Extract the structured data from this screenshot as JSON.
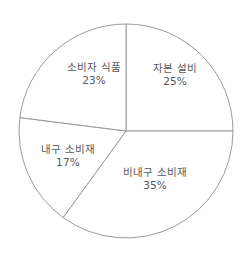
{
  "chart_data": {
    "type": "pie",
    "title": "",
    "categories": [
      "자본 설비",
      "비내구 소비재",
      "내구 소비재",
      "소비자 식품"
    ],
    "values": [
      25,
      35,
      17,
      23
    ],
    "value_labels": [
      "25%",
      "35%",
      "17%",
      "23%"
    ],
    "unit": "%",
    "legend": "none",
    "grid": false,
    "start_angle_deg": 0,
    "direction": "clockwise",
    "slice_fill": "#ffffff",
    "slice_stroke": "#9b9b9b",
    "label_color": "#575757",
    "background": "#ffffff",
    "slices": [
      {
        "label": "자본 설비",
        "value": 25,
        "value_label": "25%",
        "start_deg": 0,
        "end_deg": 90,
        "label_x_pct": 70.6,
        "label_y_pct": 28.6
      },
      {
        "label": "비내구 소비재",
        "value": 35,
        "value_label": "35%",
        "start_deg": 90,
        "end_deg": 216,
        "label_x_pct": 62.5,
        "label_y_pct": 68.3
      },
      {
        "label": "내구 소비재",
        "value": 17,
        "value_label": "17%",
        "start_deg": 216,
        "end_deg": 277.2,
        "label_x_pct": 27.4,
        "label_y_pct": 59.5
      },
      {
        "label": "소비자 식품",
        "value": 23,
        "value_label": "23%",
        "start_deg": 277.2,
        "end_deg": 360,
        "label_x_pct": 37.9,
        "label_y_pct": 28.2
      }
    ]
  },
  "geometry": {
    "center_x": 126,
    "center_y": 131,
    "radius": 107
  }
}
